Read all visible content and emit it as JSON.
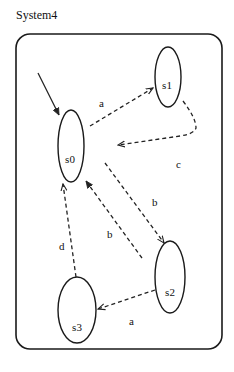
{
  "title": "System4",
  "diagram": {
    "type": "state-machine",
    "initial_state": "s0",
    "nodes": [
      {
        "id": "s0",
        "label": "s0",
        "cx": 71,
        "cy": 146,
        "rx": 13,
        "ry": 36,
        "lx": 70,
        "ly": 163
      },
      {
        "id": "s1",
        "label": "s1",
        "cx": 168,
        "cy": 77,
        "rx": 13,
        "ry": 30,
        "lx": 167,
        "ly": 89
      },
      {
        "id": "s2",
        "label": "s2",
        "cx": 170,
        "cy": 277,
        "rx": 15,
        "ry": 36,
        "lx": 170,
        "ly": 296
      },
      {
        "id": "s3",
        "label": "s3",
        "cx": 77,
        "cy": 310,
        "rx": 19,
        "ry": 33,
        "lx": 77,
        "ly": 331
      }
    ],
    "edges": [
      {
        "from": "s0",
        "to": "s1",
        "label": "a",
        "lx": 99,
        "ly": 107
      },
      {
        "from": "s1",
        "to": "s0",
        "label": "c",
        "lx": 176,
        "ly": 168
      },
      {
        "from": "s0",
        "to": "s2",
        "label": "b",
        "lx": 152,
        "ly": 206
      },
      {
        "from": "s2",
        "to": "s0",
        "label": "b",
        "lx": 107,
        "ly": 238
      },
      {
        "from": "s2",
        "to": "s3",
        "label": "a",
        "lx": 129,
        "ly": 325
      },
      {
        "from": "s3",
        "to": "s0",
        "label": "d",
        "lx": 59,
        "ly": 250
      }
    ]
  }
}
